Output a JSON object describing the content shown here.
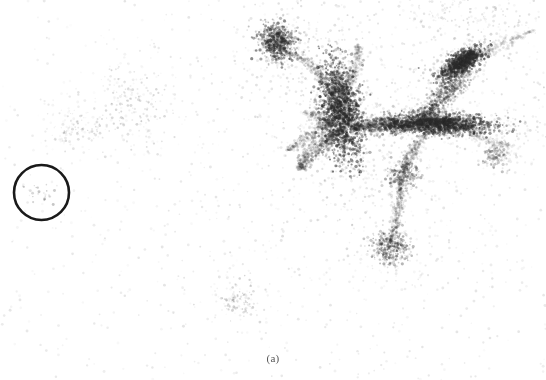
{
  "figure": {
    "caption": "(a)",
    "caption_color": "#555555",
    "background_color": "#ffffff",
    "width": 546,
    "height": 380
  },
  "annotations": [
    {
      "kind": "circle",
      "name": "highlight-circle",
      "cx": 41.5,
      "cy": 192.5,
      "r": 27.5,
      "stroke": "#1a1a1a",
      "stroke_width": 2.6,
      "fill": "none"
    }
  ],
  "chart_data": {
    "type": "scatter",
    "title": "",
    "subtitle": "",
    "xlabel": "",
    "ylabel": "",
    "xlim": [
      0,
      546
    ],
    "ylim": [
      0,
      380
    ],
    "grid": false,
    "legend": null,
    "axes_visible": false,
    "point_color": "#2b2b2b",
    "series": [
      {
        "name": "tracer-points",
        "marker": "dot",
        "color": "#2b2b2b",
        "clusters": [
          {
            "name": "main-left-knot",
            "cx": 341,
            "cy": 112,
            "sx": 10,
            "sy": 25,
            "n": 1700,
            "alpha": 0.5,
            "size": 1.5,
            "rot": -0.15
          },
          {
            "name": "main-horizontal-bar",
            "cx": 437,
            "cy": 124,
            "sx": 27,
            "sy": 5,
            "n": 1600,
            "alpha": 0.48,
            "size": 1.5,
            "rot": 0.02
          },
          {
            "name": "upper-right-knot",
            "cx": 462,
            "cy": 62,
            "sx": 13,
            "sy": 5,
            "n": 800,
            "alpha": 0.5,
            "size": 1.5,
            "rot": -0.55
          },
          {
            "name": "upper-blob",
            "cx": 277,
            "cy": 42,
            "sx": 9,
            "sy": 9,
            "n": 520,
            "alpha": 0.45,
            "size": 1.5,
            "rot": 0.0
          },
          {
            "name": "lower-clump",
            "cx": 390,
            "cy": 248,
            "sx": 9,
            "sy": 8,
            "n": 330,
            "alpha": 0.32,
            "size": 1.4,
            "rot": 0.0
          },
          {
            "name": "mid-node",
            "cx": 402,
            "cy": 176,
            "sx": 8,
            "sy": 7,
            "n": 240,
            "alpha": 0.3,
            "size": 1.4,
            "rot": 0.0
          },
          {
            "name": "right-small-clump",
            "cx": 496,
            "cy": 155,
            "sx": 7,
            "sy": 6,
            "n": 150,
            "alpha": 0.25,
            "size": 1.4,
            "rot": 0.0
          },
          {
            "name": "bottom-faint-clump",
            "cx": 240,
            "cy": 300,
            "sx": 11,
            "sy": 9,
            "n": 110,
            "alpha": 0.17,
            "size": 1.3,
            "rot": 0.0
          },
          {
            "name": "left-loose-group",
            "cx": 133,
            "cy": 105,
            "sx": 14,
            "sy": 22,
            "n": 150,
            "alpha": 0.16,
            "size": 1.3,
            "rot": -0.6
          },
          {
            "name": "lower-left-group",
            "cx": 78,
            "cy": 128,
            "sx": 16,
            "sy": 14,
            "n": 120,
            "alpha": 0.15,
            "size": 1.3,
            "rot": 0.0
          },
          {
            "name": "top-right-haze",
            "cx": 470,
            "cy": 14,
            "sx": 40,
            "sy": 10,
            "n": 140,
            "alpha": 0.13,
            "size": 1.3,
            "rot": 0.0
          },
          {
            "name": "void-interior",
            "cx": 41,
            "cy": 192,
            "sx": 9,
            "sy": 8,
            "n": 28,
            "alpha": 0.22,
            "size": 1.3,
            "rot": 0.0
          }
        ],
        "filaments": [
          {
            "name": "ur-diagonal",
            "x1": 470,
            "y1": 52,
            "x2": 418,
            "y2": 122,
            "width": 13,
            "n": 900,
            "alpha": 0.3,
            "curve": 18
          },
          {
            "name": "bar-to-leftknot",
            "x1": 412,
            "y1": 126,
            "x2": 352,
            "y2": 128,
            "width": 9,
            "n": 600,
            "alpha": 0.3,
            "curve": 8
          },
          {
            "name": "knot-fan-down",
            "x1": 338,
            "y1": 132,
            "x2": 300,
            "y2": 168,
            "width": 10,
            "n": 420,
            "alpha": 0.2,
            "curve": -12
          },
          {
            "name": "knot-fan-left",
            "x1": 332,
            "y1": 120,
            "x2": 288,
            "y2": 150,
            "width": 8,
            "n": 300,
            "alpha": 0.16,
            "curve": 10
          },
          {
            "name": "blob-tail",
            "x1": 283,
            "y1": 50,
            "x2": 330,
            "y2": 92,
            "width": 5,
            "n": 260,
            "alpha": 0.17,
            "curve": 14
          },
          {
            "name": "node-to-clump",
            "x1": 400,
            "y1": 182,
            "x2": 390,
            "y2": 242,
            "width": 6,
            "n": 300,
            "alpha": 0.16,
            "curve": 7
          },
          {
            "name": "bar-to-node",
            "x1": 428,
            "y1": 132,
            "x2": 404,
            "y2": 172,
            "width": 7,
            "n": 280,
            "alpha": 0.18,
            "curve": -9
          },
          {
            "name": "ur-tail-right",
            "x1": 474,
            "y1": 58,
            "x2": 534,
            "y2": 30,
            "width": 4,
            "n": 200,
            "alpha": 0.11,
            "curve": -16
          },
          {
            "name": "bar-tail-right",
            "x1": 464,
            "y1": 126,
            "x2": 512,
            "y2": 146,
            "width": 4,
            "n": 180,
            "alpha": 0.1,
            "curve": -12
          },
          {
            "name": "knot-top-spray",
            "x1": 344,
            "y1": 90,
            "x2": 358,
            "y2": 46,
            "width": 7,
            "n": 240,
            "alpha": 0.14,
            "curve": 10
          },
          {
            "name": "left-spray",
            "x1": 330,
            "y1": 126,
            "x2": 302,
            "y2": 112,
            "width": 5,
            "n": 160,
            "alpha": 0.12,
            "curve": 8
          }
        ],
        "field": {
          "name": "background-field",
          "n": 1500,
          "alpha": 0.1,
          "size": 1.3,
          "bias_cx": 330,
          "bias_cy": 150
        }
      }
    ]
  }
}
